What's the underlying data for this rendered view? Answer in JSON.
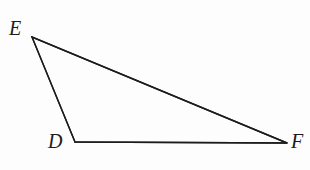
{
  "figure": {
    "name": "triangle-def",
    "type": "geometry-diagram",
    "background_color": "#fdfdfd",
    "stroke_color": "#1c1c1c",
    "stroke_width": 1.4,
    "canvas": {
      "width": 310,
      "height": 170
    },
    "vertices": [
      {
        "id": "E",
        "label": "E",
        "x": 32,
        "y": 37,
        "label_x": 9,
        "label_y": 18
      },
      {
        "id": "D",
        "label": "D",
        "x": 75,
        "y": 142,
        "label_x": 48,
        "label_y": 131
      },
      {
        "id": "F",
        "label": "F",
        "x": 287,
        "y": 143,
        "label_x": 291,
        "label_y": 131
      }
    ],
    "edges": [
      {
        "id": "ED",
        "from": "E",
        "to": "D"
      },
      {
        "id": "DF",
        "from": "D",
        "to": "F"
      },
      {
        "id": "FE",
        "from": "F",
        "to": "E"
      }
    ],
    "polygon_points": "32,37 75,142 287,143"
  }
}
